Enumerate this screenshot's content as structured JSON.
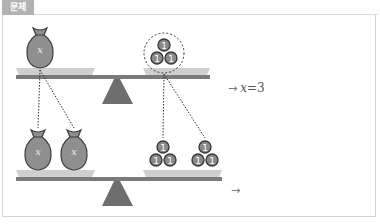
{
  "header": {
    "label": "문제"
  },
  "colors": {
    "tab_bg": "#b3b3b3",
    "frame_border": "#d4d4d4",
    "beam": "#7a7a7a",
    "pan": "#cfcfcf",
    "fulcrum": "#6e6e6e",
    "bag_fill": "#8f8f8f",
    "bag_stroke": "#3d3d3d",
    "coin_fill": "#8a8a8a",
    "coin_stroke": "#3a3a3a",
    "dotted_line": "#333333"
  },
  "diagram": {
    "top_balance": {
      "left_pan": {
        "bags": [
          {
            "label": "x"
          }
        ]
      },
      "right_pan": {
        "coins": [
          {
            "label": "1"
          },
          {
            "label": "1"
          },
          {
            "label": "1"
          }
        ],
        "grouped": true
      },
      "result": {
        "arrow": "→",
        "variable": "x",
        "equals": "=",
        "value": "3"
      }
    },
    "bottom_balance": {
      "left_pan": {
        "bags": [
          {
            "label": "x"
          },
          {
            "label": "x"
          }
        ]
      },
      "right_pan": {
        "coin_groups": [
          [
            {
              "label": "1"
            },
            {
              "label": "1"
            },
            {
              "label": "1"
            }
          ],
          [
            {
              "label": "1"
            },
            {
              "label": "1"
            },
            {
              "label": "1"
            }
          ]
        ]
      },
      "result": {
        "arrow": "→",
        "answer": ""
      }
    }
  }
}
